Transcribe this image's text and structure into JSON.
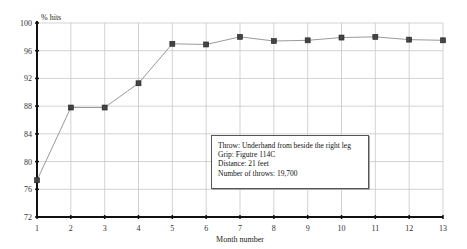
{
  "chart_data": {
    "type": "line",
    "title": "",
    "xlabel": "Month number",
    "ylabel": "% hits",
    "x": [
      1,
      2,
      3,
      4,
      5,
      6,
      7,
      8,
      9,
      10,
      11,
      12,
      13
    ],
    "series": [
      {
        "name": "% hits",
        "values": [
          77.3,
          87.8,
          87.8,
          91.3,
          97.0,
          96.9,
          98.0,
          97.4,
          97.5,
          97.9,
          98.0,
          97.6,
          97.5
        ]
      }
    ],
    "xlim": [
      1,
      13
    ],
    "ylim": [
      72,
      100
    ],
    "y_ticks": [
      72,
      76,
      80,
      84,
      88,
      92,
      96,
      100
    ],
    "x_ticks": [
      1,
      2,
      3,
      4,
      5,
      6,
      7,
      8,
      9,
      10,
      11,
      12,
      13
    ],
    "grid": true,
    "marker": "square",
    "annotation": {
      "lines": [
        "Throw: Underhand from beside the right leg",
        "Grip: Figutre 114C",
        "Distance: 21 feet",
        "Number of throws: 19,700"
      ]
    }
  },
  "colors": {
    "line": "#9a9a9a",
    "marker": "#444444",
    "grid": "#c8c8c8",
    "axis": "#111111"
  }
}
